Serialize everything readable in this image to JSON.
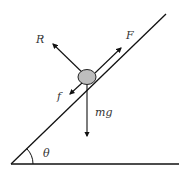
{
  "diagram": {
    "labels": {
      "normal": "R",
      "applied": "F",
      "friction": "f",
      "weight": "mg",
      "angle": "θ"
    },
    "colors": {
      "line": "#111111",
      "body_fill": "#bdbdbd",
      "body_stroke": "#222222",
      "text": "#333333"
    }
  }
}
